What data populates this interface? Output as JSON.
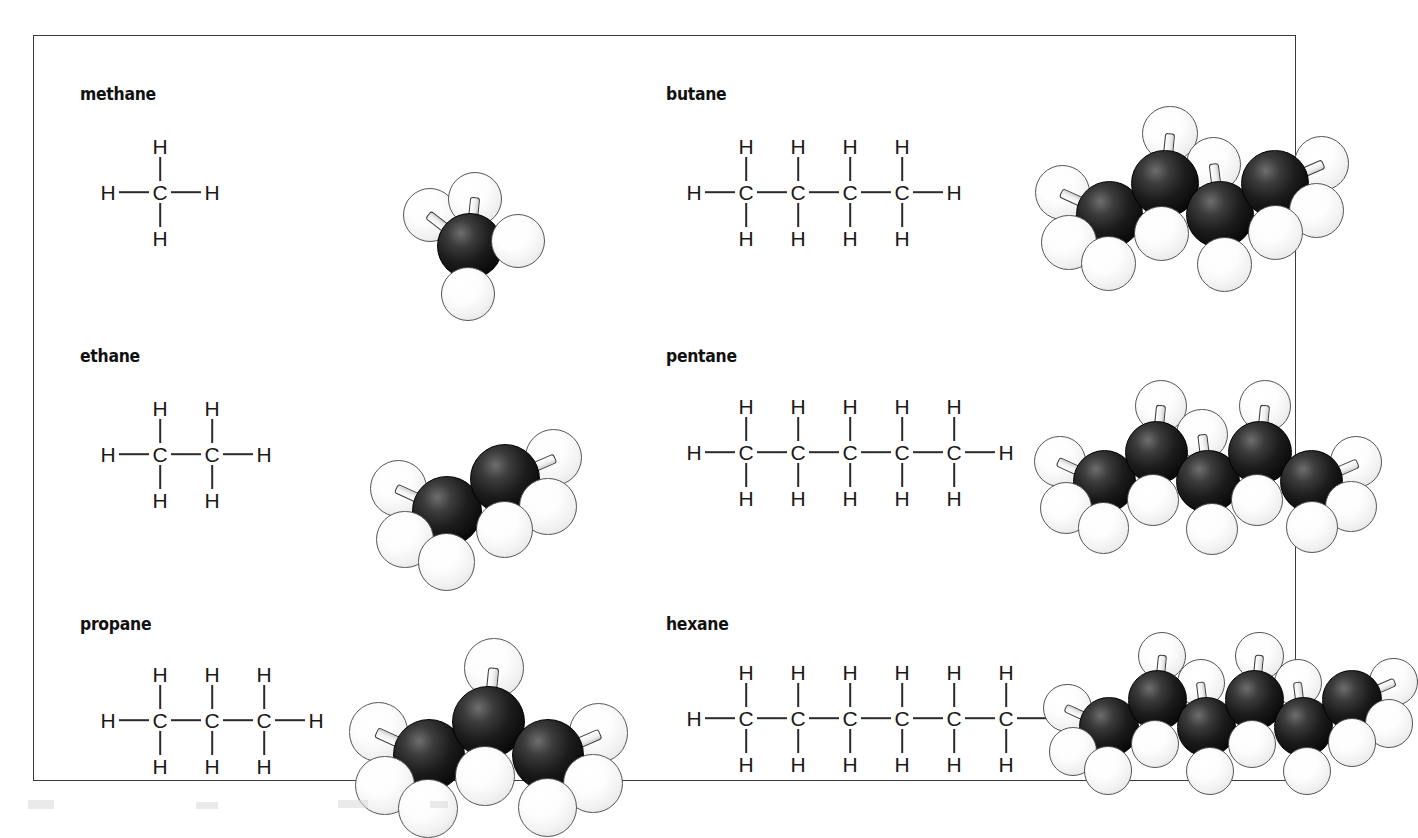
{
  "figure": {
    "kind": "chemistry-diagram",
    "border_color": "#3a3a3a",
    "background_color": "#ffffff",
    "carbon_color": "#000000",
    "hydrogen_color": "#ffffff"
  },
  "molecules": [
    {
      "name": "methane",
      "carbon_count": 1,
      "hydrogen_count": 4,
      "atoms": {
        "carbon_label": "C",
        "hydrogen_label": "H"
      },
      "chain_labels": [
        "C"
      ],
      "top_hydrogens": [
        "H"
      ],
      "bottom_hydrogens": [
        "H"
      ],
      "left_hydrogen": "H",
      "right_hydrogen": "H"
    },
    {
      "name": "ethane",
      "carbon_count": 2,
      "hydrogen_count": 6,
      "atoms": {
        "carbon_label": "C",
        "hydrogen_label": "H"
      },
      "chain_labels": [
        "C",
        "C"
      ],
      "top_hydrogens": [
        "H",
        "H"
      ],
      "bottom_hydrogens": [
        "H",
        "H"
      ],
      "left_hydrogen": "H",
      "right_hydrogen": "H"
    },
    {
      "name": "propane",
      "carbon_count": 3,
      "hydrogen_count": 8,
      "atoms": {
        "carbon_label": "C",
        "hydrogen_label": "H"
      },
      "chain_labels": [
        "C",
        "C",
        "C"
      ],
      "top_hydrogens": [
        "H",
        "H",
        "H"
      ],
      "bottom_hydrogens": [
        "H",
        "H",
        "H"
      ],
      "left_hydrogen": "H",
      "right_hydrogen": "H"
    },
    {
      "name": "butane",
      "carbon_count": 4,
      "hydrogen_count": 10,
      "atoms": {
        "carbon_label": "C",
        "hydrogen_label": "H"
      },
      "chain_labels": [
        "C",
        "C",
        "C",
        "C"
      ],
      "top_hydrogens": [
        "H",
        "H",
        "H",
        "H"
      ],
      "bottom_hydrogens": [
        "H",
        "H",
        "H",
        "H"
      ],
      "left_hydrogen": "H",
      "right_hydrogen": "H"
    },
    {
      "name": "pentane",
      "carbon_count": 5,
      "hydrogen_count": 12,
      "atoms": {
        "carbon_label": "C",
        "hydrogen_label": "H"
      },
      "chain_labels": [
        "C",
        "C",
        "C",
        "C",
        "C"
      ],
      "top_hydrogens": [
        "H",
        "H",
        "H",
        "H",
        "H"
      ],
      "bottom_hydrogens": [
        "H",
        "H",
        "H",
        "H",
        "H"
      ],
      "left_hydrogen": "H",
      "right_hydrogen": "H"
    },
    {
      "name": "hexane",
      "carbon_count": 6,
      "hydrogen_count": 14,
      "atoms": {
        "carbon_label": "C",
        "hydrogen_label": "H"
      },
      "chain_labels": [
        "C",
        "C",
        "C",
        "C",
        "C",
        "C"
      ],
      "top_hydrogens": [
        "H",
        "H",
        "H",
        "H",
        "H",
        "H"
      ],
      "bottom_hydrogens": [
        "H",
        "H",
        "H",
        "H",
        "H",
        "H"
      ],
      "left_hydrogen": "H",
      "right_hydrogen": "H"
    }
  ]
}
